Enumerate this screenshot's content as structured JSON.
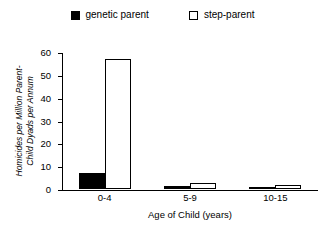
{
  "chart_data": {
    "type": "bar",
    "title": "",
    "subtitle": "",
    "xlabel": "Age of Child (years)",
    "ylabel_line1": "Homicides per Million Parent-",
    "ylabel_line2": "Child Dyads per Annum",
    "ylabel": "Homicides per Million Parent-Child Dyads per Annum",
    "categories": [
      "0-4",
      "5-9",
      "10-15"
    ],
    "series": [
      {
        "name": "genetic parent",
        "color": "#000000",
        "fill": "solid",
        "values": [
          7,
          1.5,
          0.8
        ]
      },
      {
        "name": "step-parent",
        "color": "#ffffff",
        "fill": "open",
        "values": [
          57,
          2.7,
          1.8
        ]
      }
    ],
    "ylim": [
      0,
      60
    ],
    "yticks": [
      0,
      10,
      20,
      30,
      40,
      50,
      60
    ],
    "ytick_labels": [
      "0",
      "10",
      "20",
      "30",
      "40",
      "50",
      "60"
    ],
    "grid": false,
    "legend_position": "top-center"
  },
  "legend": {
    "entries": [
      {
        "label": "genetic parent",
        "swatch": "filled-square-icon"
      },
      {
        "label": "step-parent",
        "swatch": "open-square-icon"
      }
    ]
  }
}
